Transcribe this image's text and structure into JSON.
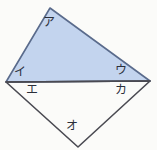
{
  "figure": {
    "name": "quadrilateral-with-shaded-triangle",
    "background_color": "#fbfbf9",
    "stroke_color": "#4a4a52",
    "triangle_fill_color": "#c3d4ee",
    "triangle_stroke_color": "#5a6b8c",
    "label_color": "#2b2f3a",
    "labels": {
      "a": "ア",
      "i": "イ",
      "u": "ウ",
      "e": "エ",
      "o": "オ",
      "ka": "カ"
    },
    "points": {
      "apex_top": {
        "x": 50,
        "y": 8
      },
      "left": {
        "x": 6,
        "y": 82
      },
      "right": {
        "x": 150,
        "y": 81
      },
      "bottom": {
        "x": 78,
        "y": 147
      }
    },
    "shapes": {
      "shaded_triangle_points": "50,8 150,81 6,82",
      "lower_triangle_points": "6,82 150,81 78,147",
      "diagonal_line": {
        "x1": 6,
        "y1": 82,
        "x2": 150,
        "y2": 81
      }
    }
  }
}
